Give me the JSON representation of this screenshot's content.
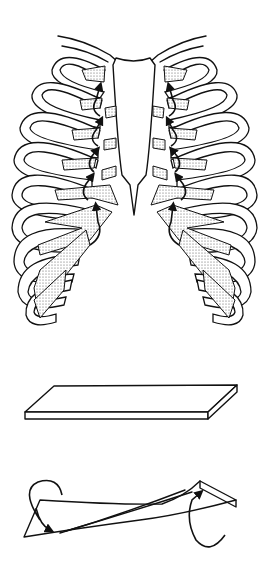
{
  "figure": {
    "panels": [
      {
        "id": "rib-cage",
        "description": "Anterior view of rib cage with stippled costal cartilages and curved arrows showing rib rotation"
      },
      {
        "id": "flat-bar",
        "description": "Flat rectangular bar at rest"
      },
      {
        "id": "twisted-bar",
        "description": "Same bar twisted, with curved arrows indicating torsion at each end"
      }
    ],
    "colors": {
      "line": "#111111",
      "background": "#ffffff",
      "stipple": "#555555"
    }
  }
}
